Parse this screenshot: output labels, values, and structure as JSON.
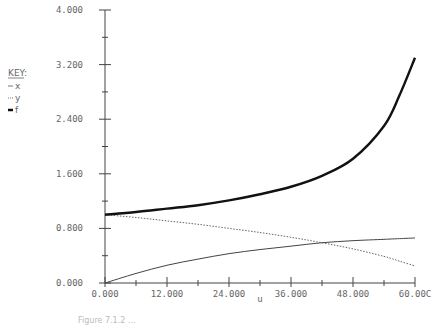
{
  "chart_data": {
    "type": "line",
    "title": "",
    "xlabel": "u",
    "ylabel": "",
    "xlim": [
      0,
      60
    ],
    "ylim": [
      0,
      4
    ],
    "x_ticks": [
      "0.000",
      "12.000",
      "24.000",
      "36.000",
      "48.000",
      "60.000"
    ],
    "y_ticks": [
      "0.000",
      "0.800",
      "1.600",
      "2.400",
      "3.200",
      "4.000"
    ],
    "grid": false,
    "legend": {
      "title": "KEY:",
      "position": "left",
      "entries": [
        {
          "name": "x",
          "style": "thin-solid"
        },
        {
          "name": "y",
          "style": "dotted"
        },
        {
          "name": "f",
          "style": "thick-solid"
        }
      ]
    },
    "x": [
      0,
      6,
      12,
      18,
      24,
      30,
      36,
      42,
      48,
      54,
      57,
      60
    ],
    "series": [
      {
        "name": "x",
        "values": [
          0.0,
          0.14,
          0.26,
          0.35,
          0.43,
          0.49,
          0.54,
          0.59,
          0.62,
          0.64,
          0.65,
          0.66
        ]
      },
      {
        "name": "y",
        "values": [
          1.0,
          0.96,
          0.91,
          0.86,
          0.8,
          0.74,
          0.67,
          0.59,
          0.5,
          0.39,
          0.32,
          0.25
        ]
      },
      {
        "name": "f",
        "values": [
          1.0,
          1.04,
          1.09,
          1.14,
          1.21,
          1.3,
          1.41,
          1.57,
          1.82,
          2.3,
          2.75,
          3.3
        ]
      }
    ],
    "annotations": [
      "Figure (caption cut off)"
    ]
  },
  "legend": {
    "title": "KEY:",
    "items": [
      {
        "label": "x"
      },
      {
        "label": "y"
      },
      {
        "label": "f"
      }
    ]
  },
  "axes": {
    "x_label": "u",
    "x_ticks": [
      "0.000",
      "12.000",
      "24.000",
      "36.000",
      "48.000",
      "60.00C"
    ],
    "y_ticks": [
      "0.000",
      "0.800",
      "1.600",
      "2.400",
      "3.200",
      "4.000"
    ]
  },
  "caption": "Figure 7.1.2 ..."
}
